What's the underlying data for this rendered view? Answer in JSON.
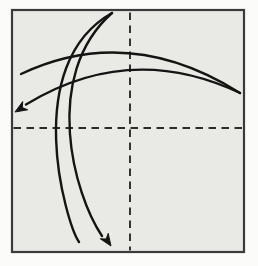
{
  "diagram": {
    "kind": "origami-step-diagram",
    "canvas": {
      "width": 258,
      "height": 266,
      "background": "#fbfbf9"
    },
    "colors": {
      "paper": "#e9e9e6",
      "outline": "#3b3b3b",
      "crease": "#2b2b2b",
      "arrow": "#141414"
    },
    "elements": [
      {
        "tag": "rect",
        "name": "paper-square",
        "attrs": {
          "x": 12,
          "y": 10,
          "width": 232,
          "height": 242,
          "fill": "#e9e9e6",
          "stroke": "#3b3b3b",
          "stroke-width": 2.2
        }
      },
      {
        "tag": "line",
        "name": "vertical-crease-line",
        "attrs": {
          "x1": 130,
          "y1": 12.5,
          "x2": 130,
          "y2": 250.5,
          "stroke": "#2b2b2b",
          "stroke-width": 1.9,
          "stroke-dasharray": "7.5 5.5",
          "fill": "none"
        }
      },
      {
        "tag": "line",
        "name": "horizontal-crease-line",
        "attrs": {
          "x1": 13.5,
          "y1": 128,
          "x2": 242.5,
          "y2": 128,
          "stroke": "#2b2b2b",
          "stroke-width": 1.9,
          "stroke-dasharray": "7.5 5.5",
          "fill": "none"
        }
      },
      {
        "tag": "path",
        "name": "horizontal-fold-arrow-outgoing-arc",
        "attrs": {
          "d": "M 21 74 Q 129 23 240 93",
          "fill": "none",
          "stroke": "#141414",
          "stroke-width": 2.4,
          "stroke-linecap": "round"
        }
      },
      {
        "tag": "path",
        "name": "horizontal-fold-arrow-return-arc",
        "attrs": {
          "d": "M 240 93 Q 130 41 26 104.5",
          "fill": "none",
          "stroke": "#141414",
          "stroke-width": 2.4,
          "stroke-linecap": "round"
        }
      },
      {
        "tag": "polygon",
        "name": "left-arrowhead-icon",
        "attrs": {
          "points": "15,112 22.7,101.6 22.3,107.6 27.7,109.8",
          "fill": "#141414",
          "stroke": "#141414",
          "stroke-width": 1,
          "stroke-linejoin": "round"
        }
      },
      {
        "tag": "path",
        "name": "vertical-fold-arrow-outgoing-arc",
        "attrs": {
          "d": "M 79 242 C 66 223 20 65 112 13",
          "fill": "none",
          "stroke": "#141414",
          "stroke-width": 2.4,
          "stroke-linecap": "round"
        }
      },
      {
        "tag": "path",
        "name": "vertical-fold-arrow-return-arc",
        "attrs": {
          "d": "M 112 13 C 41 76 74 195 102 236",
          "fill": "none",
          "stroke": "#141414",
          "stroke-width": 2.4,
          "stroke-linecap": "round"
        }
      },
      {
        "tag": "polygon",
        "name": "bottom-arrowhead-icon",
        "attrs": {
          "points": "111,246 100.3,238.8 106.2,239 108.2,233.4",
          "fill": "#141414",
          "stroke": "#141414",
          "stroke-width": 1,
          "stroke-linejoin": "round"
        }
      }
    ]
  }
}
